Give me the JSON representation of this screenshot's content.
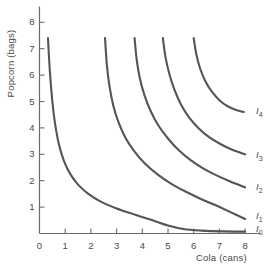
{
  "chart_data": {
    "type": "line",
    "title": "",
    "xlabel": "Cola (cans)",
    "ylabel": "Popcorn (bags)",
    "xlim": [
      0,
      8.6
    ],
    "ylim": [
      0,
      8.6
    ],
    "xticks": [
      0,
      1,
      2,
      3,
      4,
      5,
      6,
      7,
      8
    ],
    "yticks": [
      1,
      2,
      3,
      4,
      5,
      6,
      7,
      8
    ],
    "xtick_labels": [
      "0",
      "1",
      "2",
      "3",
      "4",
      "5",
      "6",
      "7",
      "8"
    ],
    "ytick_labels": [
      "1",
      "2",
      "3",
      "4",
      "5",
      "6",
      "7",
      "8"
    ],
    "grid": false,
    "legend_position": "inline-right-of-curve-ends",
    "curve_color": "#555555",
    "axis_color": "#6a6a6a",
    "series": [
      {
        "name": "I0",
        "label": "I",
        "subscript": "0",
        "label_x": 8.35,
        "label_y": 0.12,
        "points": [
          [
            0.33,
            7.4
          ],
          [
            0.4,
            6.2
          ],
          [
            0.5,
            5.0
          ],
          [
            0.6,
            4.2
          ],
          [
            0.75,
            3.4
          ],
          [
            0.95,
            2.75
          ],
          [
            1.2,
            2.25
          ],
          [
            1.5,
            1.85
          ],
          [
            1.9,
            1.5
          ],
          [
            2.4,
            1.2
          ],
          [
            3.0,
            0.95
          ],
          [
            3.7,
            0.72
          ],
          [
            4.4,
            0.5
          ],
          [
            5.0,
            0.3
          ],
          [
            5.6,
            0.17
          ],
          [
            6.3,
            0.11
          ],
          [
            7.1,
            0.08
          ],
          [
            8.0,
            0.07
          ]
        ]
      },
      {
        "name": "I1",
        "label": "I",
        "subscript": "1",
        "label_x": 8.35,
        "label_y": 0.62,
        "points": [
          [
            2.55,
            7.4
          ],
          [
            2.62,
            6.4
          ],
          [
            2.72,
            5.6
          ],
          [
            2.87,
            4.85
          ],
          [
            3.08,
            4.2
          ],
          [
            3.35,
            3.62
          ],
          [
            3.7,
            3.1
          ],
          [
            4.1,
            2.65
          ],
          [
            4.58,
            2.25
          ],
          [
            5.1,
            1.9
          ],
          [
            5.7,
            1.58
          ],
          [
            6.3,
            1.3
          ],
          [
            6.9,
            1.05
          ],
          [
            7.45,
            0.8
          ],
          [
            8.0,
            0.55
          ]
        ]
      },
      {
        "name": "I2",
        "label": "I",
        "subscript": "2",
        "label_x": 8.35,
        "label_y": 1.72,
        "points": [
          [
            3.7,
            7.4
          ],
          [
            3.78,
            6.6
          ],
          [
            3.9,
            5.9
          ],
          [
            4.08,
            5.25
          ],
          [
            4.32,
            4.65
          ],
          [
            4.62,
            4.1
          ],
          [
            5.0,
            3.6
          ],
          [
            5.42,
            3.15
          ],
          [
            5.88,
            2.78
          ],
          [
            6.35,
            2.48
          ],
          [
            6.85,
            2.22
          ],
          [
            7.4,
            1.98
          ],
          [
            8.0,
            1.75
          ]
        ]
      },
      {
        "name": "I3",
        "label": "I",
        "subscript": "3",
        "label_x": 8.35,
        "label_y": 2.95,
        "points": [
          [
            4.8,
            7.4
          ],
          [
            4.9,
            6.7
          ],
          [
            5.05,
            6.05
          ],
          [
            5.25,
            5.45
          ],
          [
            5.5,
            4.9
          ],
          [
            5.82,
            4.4
          ],
          [
            6.2,
            3.98
          ],
          [
            6.6,
            3.65
          ],
          [
            7.02,
            3.4
          ],
          [
            7.5,
            3.17
          ],
          [
            8.0,
            3.0
          ]
        ]
      },
      {
        "name": "I4",
        "label": "I",
        "subscript": "4",
        "label_x": 8.35,
        "label_y": 4.6,
        "points": [
          [
            6.0,
            7.4
          ],
          [
            6.1,
            6.8
          ],
          [
            6.25,
            6.25
          ],
          [
            6.45,
            5.78
          ],
          [
            6.7,
            5.38
          ],
          [
            7.0,
            5.05
          ],
          [
            7.32,
            4.82
          ],
          [
            7.65,
            4.68
          ],
          [
            7.95,
            4.6
          ]
        ]
      }
    ]
  }
}
